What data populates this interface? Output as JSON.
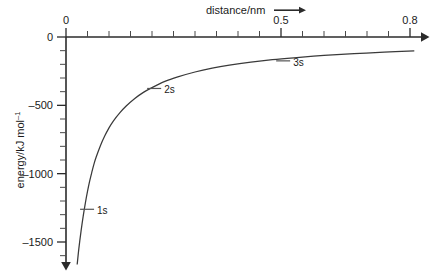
{
  "figure": {
    "background_color": "#ffffff",
    "ink_color": "#2b2b2b",
    "curve_color": "#3a3a3a"
  },
  "chart_data": {
    "type": "line",
    "title": "",
    "xlabel": "distance/nm",
    "ylabel": "energy/kJ mol−1",
    "ylabel_base": "energy/kJ mol",
    "ylabel_exponent": "–1",
    "xlim": [
      0,
      0.85
    ],
    "ylim": [
      -1700,
      0
    ],
    "grid": false,
    "legend": "none",
    "x_ticks_major": [
      0,
      0.5,
      0.8
    ],
    "x_tick_labels": [
      "0",
      "0.5",
      "0.8"
    ],
    "x_ticks_minor_step": 0.05,
    "y_ticks_major": [
      0,
      -500,
      -1000,
      -1500
    ],
    "y_tick_labels": [
      "0",
      "–500",
      "–1000",
      "–1500"
    ],
    "y_ticks_minor_step": 100,
    "x_axis_arrow": true,
    "y_axis_arrow": true,
    "series": [
      {
        "name": "energy vs distance",
        "x": [
          0.026,
          0.03,
          0.035,
          0.04,
          0.045,
          0.05,
          0.055,
          0.06,
          0.065,
          0.07,
          0.08,
          0.09,
          0.1,
          0.11,
          0.125,
          0.14,
          0.16,
          0.18,
          0.2,
          0.23,
          0.26,
          0.3,
          0.34,
          0.38,
          0.43,
          0.48,
          0.53,
          0.6,
          0.67,
          0.74,
          0.81
        ],
        "y": [
          -1665,
          -1545,
          -1420,
          -1310,
          -1215,
          -1130,
          -1055,
          -990,
          -930,
          -880,
          -795,
          -725,
          -665,
          -615,
          -555,
          -505,
          -450,
          -405,
          -370,
          -325,
          -292,
          -256,
          -228,
          -206,
          -184,
          -166,
          -152,
          -135,
          -122,
          -111,
          -102
        ]
      }
    ],
    "annotations": [
      {
        "label": "1s",
        "x": 0.049,
        "y": -1246,
        "leader": "tick"
      },
      {
        "label": "2s",
        "x": 0.205,
        "y": -362,
        "leader": "tick"
      },
      {
        "label": "3s",
        "x": 0.505,
        "y": -160,
        "leader": "tick"
      }
    ]
  }
}
